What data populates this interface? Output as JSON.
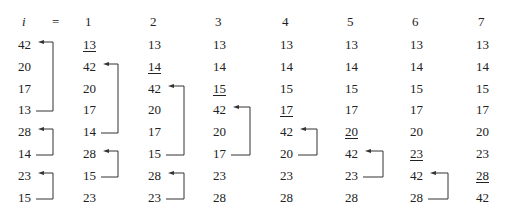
{
  "header": {
    "var_label": "i",
    "equals": "=",
    "passes": [
      "1",
      "2",
      "3",
      "4",
      "5",
      "6",
      "7"
    ]
  },
  "columns": [
    {
      "pass": "initial",
      "values": [
        "42",
        "20",
        "17",
        "13",
        "28",
        "14",
        "23",
        "15"
      ],
      "underlined": []
    },
    {
      "pass": "1",
      "values": [
        "13",
        "42",
        "20",
        "17",
        "14",
        "28",
        "15",
        "23"
      ],
      "underlined": [
        0
      ]
    },
    {
      "pass": "2",
      "values": [
        "13",
        "14",
        "42",
        "20",
        "17",
        "15",
        "28",
        "23"
      ],
      "underlined": [
        1
      ]
    },
    {
      "pass": "3",
      "values": [
        "13",
        "14",
        "15",
        "42",
        "20",
        "17",
        "23",
        "28"
      ],
      "underlined": [
        2
      ]
    },
    {
      "pass": "4",
      "values": [
        "13",
        "14",
        "15",
        "17",
        "42",
        "20",
        "23",
        "28"
      ],
      "underlined": [
        3
      ]
    },
    {
      "pass": "5",
      "values": [
        "13",
        "14",
        "15",
        "17",
        "20",
        "42",
        "23",
        "28"
      ],
      "underlined": [
        4
      ]
    },
    {
      "pass": "6",
      "values": [
        "13",
        "14",
        "15",
        "17",
        "20",
        "23",
        "42",
        "28"
      ],
      "underlined": [
        5
      ]
    },
    {
      "pass": "7",
      "values": [
        "13",
        "14",
        "15",
        "17",
        "20",
        "23",
        "28",
        "42"
      ],
      "underlined": [
        6
      ]
    }
  ],
  "arrows": [
    {
      "col": 0,
      "from_row": 3,
      "to_row": 0
    },
    {
      "col": 0,
      "from_row": 5,
      "to_row": 4
    },
    {
      "col": 0,
      "from_row": 7,
      "to_row": 6
    },
    {
      "col": 1,
      "from_row": 4,
      "to_row": 1
    },
    {
      "col": 1,
      "from_row": 6,
      "to_row": 5
    },
    {
      "col": 2,
      "from_row": 5,
      "to_row": 2
    },
    {
      "col": 2,
      "from_row": 7,
      "to_row": 6
    },
    {
      "col": 3,
      "from_row": 5,
      "to_row": 3
    },
    {
      "col": 4,
      "from_row": 5,
      "to_row": 4
    },
    {
      "col": 5,
      "from_row": 6,
      "to_row": 5
    },
    {
      "col": 6,
      "from_row": 7,
      "to_row": 6
    }
  ],
  "colors": {
    "text": "#222222",
    "line": "#333333"
  }
}
